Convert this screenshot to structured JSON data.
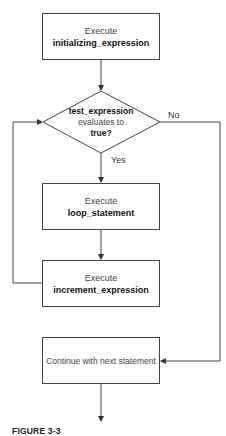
{
  "diagram": {
    "init_box": {
      "line1": "Execute",
      "line2": "initializing_expression"
    },
    "decision": {
      "line1": "test_expression",
      "line2": "evaluates to",
      "line3": "true?"
    },
    "yes_label": "Yes",
    "no_label": "No",
    "loop_box": {
      "line1": "Execute",
      "line2": "loop_statement"
    },
    "increment_box": {
      "line1": "Execute",
      "line2": "increment_expression"
    },
    "continue_box": {
      "line1": "Continue with next statement"
    }
  },
  "caption": "FIGURE 3-3",
  "colors": {
    "line": "#444444",
    "text": "#222222",
    "background": "#ffffff"
  }
}
